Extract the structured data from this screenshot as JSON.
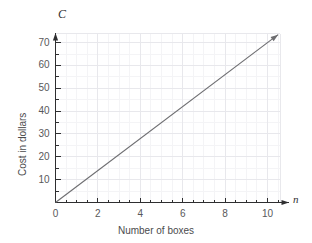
{
  "chart_data": {
    "type": "line",
    "title": "",
    "xlabel": "Number of boxes",
    "ylabel": "Cost in dollars",
    "x_var": "n",
    "y_var": "C",
    "xlim": [
      0,
      10.6
    ],
    "ylim": [
      0,
      74
    ],
    "xticks": [
      0,
      2,
      4,
      6,
      8,
      10
    ],
    "yticks": [
      10,
      20,
      30,
      40,
      50,
      60,
      70
    ],
    "xtick_labels": [
      "0",
      "2",
      "4",
      "6",
      "8",
      "10"
    ],
    "ytick_labels": [
      "10",
      "20",
      "30",
      "40",
      "50",
      "60",
      "70"
    ],
    "x_minor_step": 0.5,
    "y_minor_step": 5,
    "grid": true,
    "grid_major_color": "#e8e8ec",
    "grid_minor_color": "#f4f4f6",
    "axis_color": "#2e2e30",
    "line_color": "#6d6d70",
    "tick_label_color": "#58585a",
    "legend": null,
    "series": [
      {
        "name": "Cost",
        "slope": 7,
        "intercept": 0,
        "equation": "C = 7n",
        "arrow_end": true,
        "points": [
          {
            "n": 0,
            "C": 0
          },
          {
            "n": 1,
            "C": 7
          },
          {
            "n": 2,
            "C": 14
          },
          {
            "n": 3,
            "C": 21
          },
          {
            "n": 4,
            "C": 28
          },
          {
            "n": 5,
            "C": 35
          },
          {
            "n": 6,
            "C": 42
          },
          {
            "n": 7,
            "C": 49
          },
          {
            "n": 8,
            "C": 56
          },
          {
            "n": 9,
            "C": 63
          },
          {
            "n": 10,
            "C": 70
          },
          {
            "n": 10.5,
            "C": 73.5
          }
        ]
      }
    ]
  }
}
